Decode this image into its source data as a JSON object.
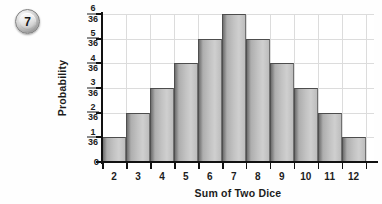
{
  "badge": {
    "number": "7",
    "icon": "numbered-circle-badge"
  },
  "chart_data": {
    "type": "bar",
    "title": "",
    "xlabel": "Sum of Two Dice",
    "ylabel": "Probability",
    "categories": [
      "2",
      "3",
      "4",
      "5",
      "6",
      "7",
      "8",
      "9",
      "10",
      "11",
      "12"
    ],
    "values": [
      1,
      2,
      3,
      4,
      5,
      6,
      5,
      4,
      3,
      2,
      1
    ],
    "value_labels": [
      "1/36",
      "2/36",
      "3/36",
      "4/36",
      "5/36",
      "6/36",
      "5/36",
      "4/36",
      "3/36",
      "2/36",
      "1/36"
    ],
    "value_denominator": 36,
    "ylim": [
      0,
      6
    ],
    "ytick_values": [
      0,
      1,
      2,
      3,
      4,
      5,
      6
    ],
    "ytick_labels": [
      "0",
      "1/36",
      "2/36",
      "3/36",
      "4/36",
      "5/36",
      "6/36"
    ],
    "ytick_numerators": [
      "0",
      "1",
      "2",
      "3",
      "4",
      "5",
      "6"
    ],
    "ytick_denominators": [
      "",
      "36",
      "36",
      "36",
      "36",
      "36",
      "36"
    ],
    "grid": true,
    "legend": false,
    "bar_color": "#c2c2c2",
    "bar_edge_color": "#4d4d4d",
    "grid_color": "#dcdcdc",
    "axis_color": "#111111",
    "text_color": "#1c1c1c"
  }
}
